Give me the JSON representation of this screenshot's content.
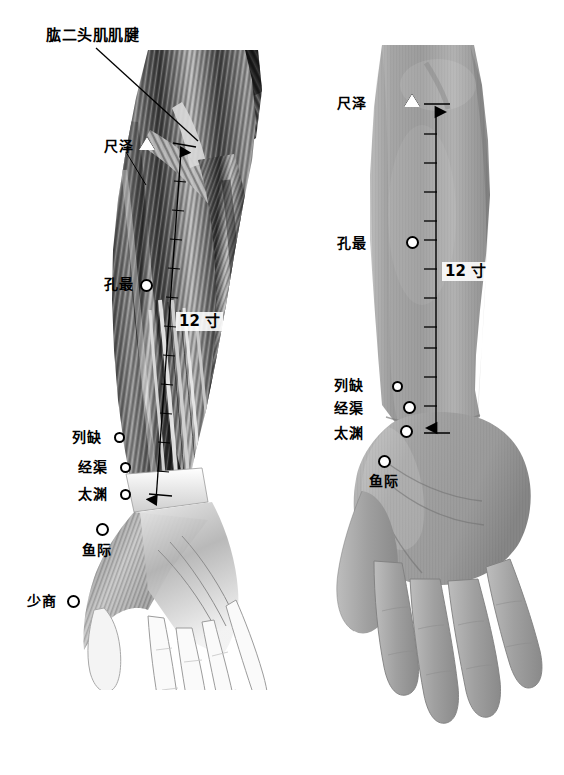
{
  "figure": {
    "background_color": "#ffffff",
    "width": 564,
    "height": 775,
    "panels": [
      {
        "id": "left",
        "type": "anatomical-illustration",
        "caption": "前臂掌侧肌肉解剖图（手太阴肺经）"
      },
      {
        "id": "right",
        "type": "surface-photograph",
        "caption": "前臂掌侧体表照片（手太阴肺经）"
      }
    ]
  },
  "anatomy_label": {
    "text": "肱二头肌肌腱"
  },
  "measure": {
    "cun_left": "12 寸",
    "cun_right": "12 寸",
    "tick_count": 11
  },
  "left_panel": {
    "points": [
      {
        "name": "尺泽",
        "marker": "triangle",
        "label_x": 104,
        "label_y": 139,
        "dot_x": 146,
        "dot_y": 141
      },
      {
        "name": "孔最",
        "marker": "circle",
        "label_x": 104,
        "label_y": 282,
        "dot_x": 142,
        "dot_y": 285
      },
      {
        "name": "列缺",
        "marker": "circle",
        "label_x": 73,
        "label_y": 432,
        "dot_x": 120,
        "dot_y": 437
      },
      {
        "name": "经渠",
        "marker": "circle",
        "label_x": 79,
        "label_y": 462,
        "dot_x": 126,
        "dot_y": 468
      },
      {
        "name": "太渊",
        "marker": "circle",
        "label_x": 79,
        "label_y": 489,
        "dot_x": 126,
        "dot_y": 495
      },
      {
        "name": "鱼际",
        "marker": "circle",
        "label_x": 83,
        "label_y": 545,
        "dot_x": 100,
        "dot_y": 527
      },
      {
        "name": "少商",
        "marker": "circle",
        "label_x": 28,
        "label_y": 596,
        "dot_x": 72,
        "dot_y": 600
      }
    ]
  },
  "right_panel": {
    "points": [
      {
        "name": "尺泽",
        "marker": "triangle",
        "label_x": 338,
        "label_y": 96,
        "dot_x": 410,
        "dot_y": 98
      },
      {
        "name": "孔最",
        "marker": "circle",
        "label_x": 338,
        "label_y": 236,
        "dot_x": 409,
        "dot_y": 240
      },
      {
        "name": "列缺",
        "marker": "circle",
        "label_x": 335,
        "label_y": 378,
        "dot_x": 396,
        "dot_y": 384
      },
      {
        "name": "经渠",
        "marker": "circle",
        "label_x": 335,
        "label_y": 403,
        "dot_x": 407,
        "dot_y": 406
      },
      {
        "name": "太渊",
        "marker": "circle",
        "label_x": 335,
        "label_y": 428,
        "dot_x": 404,
        "dot_y": 430
      },
      {
        "name": "鱼际",
        "marker": "circle",
        "label_x": 370,
        "label_y": 475,
        "dot_x": 382,
        "dot_y": 459
      }
    ]
  }
}
